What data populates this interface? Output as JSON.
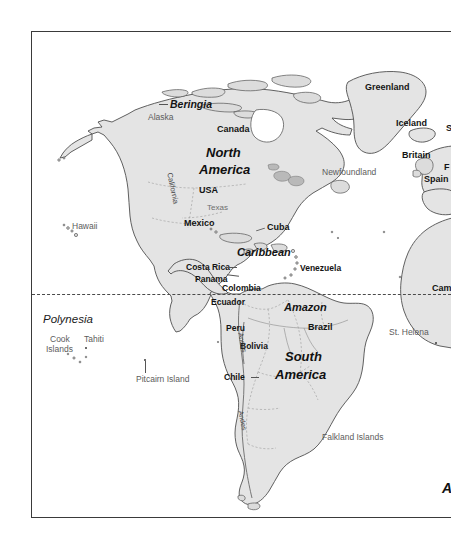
{
  "figure": {
    "kind": "world-map-fragment",
    "frame": {
      "border_color": "#3a3a3a",
      "background": "#ffffff"
    },
    "land_fill": "#e2e2e2",
    "land_stroke": "#4a4a4a",
    "equator": {
      "style": "dashed",
      "color": "#4a4a4a",
      "label": ""
    }
  },
  "labels": {
    "continents": [
      {
        "text": "North",
        "style": "region"
      },
      {
        "text": "America",
        "style": "region"
      },
      {
        "text": "South",
        "style": "region"
      },
      {
        "text": "America",
        "style": "region"
      }
    ],
    "regions": [
      {
        "text": "Beringia",
        "style": "bold-italic"
      },
      {
        "text": "Caribbean",
        "style": "bold-italic"
      },
      {
        "text": "Amazon",
        "style": "bold-italic"
      },
      {
        "text": "Polynesia",
        "style": "italic"
      }
    ],
    "countries": [
      {
        "text": "Greenland"
      },
      {
        "text": "Iceland"
      },
      {
        "text": "Britain"
      },
      {
        "text": "Spain"
      },
      {
        "text": "Canada"
      },
      {
        "text": "USA"
      },
      {
        "text": "Mexico"
      },
      {
        "text": "Cuba"
      },
      {
        "text": "Costa Rica"
      },
      {
        "text": "Panama"
      },
      {
        "text": "Colombia"
      },
      {
        "text": "Venezuela"
      },
      {
        "text": "Ecuador"
      },
      {
        "text": "Peru"
      },
      {
        "text": "Bolivia"
      },
      {
        "text": "Brazil"
      },
      {
        "text": "Chile"
      }
    ],
    "secondary": [
      {
        "text": "Alaska"
      },
      {
        "text": "Texas"
      },
      {
        "text": "California"
      },
      {
        "text": "Newfoundland"
      },
      {
        "text": "Andes"
      },
      {
        "text": "Hawaii"
      },
      {
        "text": "Cook"
      },
      {
        "text": "Islands"
      },
      {
        "text": "Tahiti"
      },
      {
        "text": "Pitcairn Island"
      },
      {
        "text": "St. Helena"
      },
      {
        "text": "Falkland Islands"
      }
    ],
    "clipped_right_edge": [
      {
        "text": "S"
      },
      {
        "text": "F"
      },
      {
        "text": "Spain"
      },
      {
        "text": "Cam"
      },
      {
        "text": "A"
      }
    ]
  },
  "map": {
    "greenland": "Greenland",
    "iceland": "Iceland",
    "britain": "Britain",
    "spain": "Spain",
    "scandinavia_clip": "S",
    "france_clip": "F",
    "cameroon_clip": "Cam",
    "atlantic_clip": "A",
    "beringia": "Beringia",
    "alaska": "Alaska",
    "canada": "Canada",
    "north": "North",
    "america_n": "America",
    "usa": "USA",
    "texas": "Texas",
    "california": "California",
    "newfoundland": "Newfoundland",
    "mexico": "Mexico",
    "cuba": "Cuba",
    "caribbean": "Caribbean",
    "costa_rica": "Costa Rica",
    "panama": "Panama",
    "colombia": "Colombia",
    "venezuela": "Venezuela",
    "ecuador": "Ecuador",
    "amazon": "Amazon",
    "peru": "Peru",
    "brazil": "Brazil",
    "bolivia": "Bolivia",
    "south": "South",
    "america_s": "America",
    "chile": "Chile",
    "andes": "Andes",
    "hawaii": "Hawaii",
    "polynesia": "Polynesia",
    "cook": "Cook",
    "islands": "Islands",
    "tahiti": "Tahiti",
    "pitcairn": "Pitcairn Island",
    "st_helena": "St. Helena",
    "falkland": "Falkland Islands"
  }
}
